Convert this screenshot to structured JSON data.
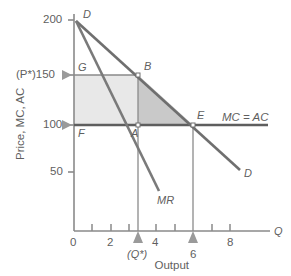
{
  "chart_data": {
    "type": "line",
    "title": "",
    "xlabel": "Output",
    "ylabel": "Price, MC, AC",
    "xlim": [
      0,
      10
    ],
    "ylim": [
      0,
      210
    ],
    "grid": false,
    "legend": "none",
    "x_ticks_major": [
      "0",
      "2",
      "4",
      "6",
      "8"
    ],
    "x_tick_values": [
      0,
      2,
      4,
      6,
      8
    ],
    "x_minor_tick_values": [
      1,
      3,
      5,
      7,
      9
    ],
    "y_ticks": [
      "200",
      "150",
      "100",
      "50"
    ],
    "y_tick_values": [
      200,
      150,
      100,
      50
    ],
    "series": [
      {
        "name": "D",
        "label": "D",
        "type": "line",
        "points": [
          [
            0,
            200
          ],
          [
            9,
            20
          ]
        ],
        "comment": "Demand curve from (0,200) falling to the right"
      },
      {
        "name": "MR",
        "label": "MR",
        "type": "line",
        "points": [
          [
            0,
            200
          ],
          [
            4.6,
            25
          ]
        ],
        "comment": "Marginal revenue, twice the slope of demand"
      },
      {
        "name": "MC = AC",
        "label": "MC = AC",
        "type": "line",
        "points": [
          [
            0,
            100
          ],
          [
            10,
            100
          ]
        ],
        "comment": "Horizontal constant marginal and average cost at 100"
      }
    ],
    "points": [
      {
        "label": "D",
        "x": 0,
        "y": 200,
        "label_pos": "right-top"
      },
      {
        "label": "G",
        "x": 0,
        "y": 150,
        "label_pos": "right-below"
      },
      {
        "label": "B",
        "x": 3,
        "y": 150,
        "label_pos": "right-above"
      },
      {
        "label": "F",
        "x": 0,
        "y": 100,
        "label_pos": "right-below"
      },
      {
        "label": "A",
        "x": 3,
        "y": 100,
        "label_pos": "left-below"
      },
      {
        "label": "E",
        "x": 6,
        "y": 100,
        "label_pos": "right-above"
      }
    ],
    "shaded_regions": [
      {
        "name": "profit-rectangle",
        "vertices": [
          [
            0,
            100
          ],
          [
            0,
            150
          ],
          [
            3,
            150
          ],
          [
            3,
            100
          ]
        ],
        "color": "#e8e8e8",
        "comment": "Monopoly profit area F-G-B-A"
      },
      {
        "name": "deadweight-loss-triangle",
        "vertices": [
          [
            3,
            150
          ],
          [
            6,
            100
          ],
          [
            3,
            100
          ]
        ],
        "color": "#c9c9c9",
        "comment": "Deadweight loss triangle A-B-E"
      }
    ],
    "annotations": [
      {
        "text": "(P*)150",
        "axis": "y",
        "value": 150,
        "marker": "triangle-right"
      },
      {
        "text": "100",
        "axis": "y",
        "value": 100,
        "marker": "triangle-right"
      },
      {
        "text": "(Q*)",
        "axis": "x",
        "value": 3,
        "marker": "triangle-up"
      },
      {
        "text": "6",
        "axis": "x",
        "value": 6,
        "marker": "triangle-up"
      },
      {
        "text": "Q",
        "axis": "x",
        "value": 10,
        "marker": "axis-name"
      }
    ],
    "colors": {
      "demand_line": "#6f6f6f",
      "mr_line": "#7a7a7a",
      "mc_ac_line": "#5e5e5e",
      "axis": "#8a8a8a",
      "text": "#5f5f5f",
      "shade_light": "#e8e8e8",
      "shade_dark": "#c9c9c9",
      "background": "#ffffff"
    }
  },
  "labels": {
    "y_200": "200",
    "y_150": "(P*)150",
    "y_100": "100",
    "y_50": "50",
    "x_0": "0",
    "x_2": "2",
    "x_4": "4",
    "x_6": "6",
    "x_8": "8",
    "q_star": "(Q*)",
    "six_marker": "6",
    "axis_q": "Q",
    "point_D_top": "D",
    "point_G": "G",
    "point_B": "B",
    "point_F": "F",
    "point_A": "A",
    "point_E": "E",
    "curve_MC_AC": "MC = AC",
    "curve_MR": "MR",
    "curve_D": "D",
    "x_axis_title": "Output",
    "y_axis_title": "Price, MC, AC"
  }
}
